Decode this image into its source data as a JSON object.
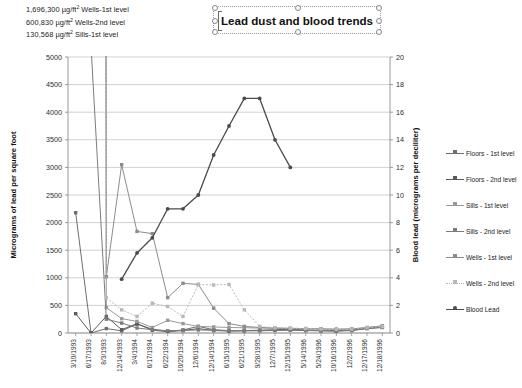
{
  "annotations": [
    {
      "value": "1,696,300",
      "unit": "µg/ft",
      "sup": "2",
      "text": "Wells-1st level"
    },
    {
      "value": "600,830",
      "unit": "µg/ft",
      "sup": "2",
      "text": "Wells-2nd level"
    },
    {
      "value": "130,568",
      "unit": "µg/ft",
      "sup": "2",
      "text": "Sills-1st level"
    }
  ],
  "title_box": {
    "title": "Lead dust and blood trends",
    "selected": true
  },
  "chart_data": {
    "type": "line",
    "title": "Lead dust and blood trends",
    "xlabel": "",
    "ylabel": "Micrograms of lead per square foot",
    "y2label": "Blood lead (micrograms per deciliter)",
    "ylim": [
      0,
      5000
    ],
    "yticks": [
      0,
      500,
      1000,
      1500,
      2000,
      2500,
      3000,
      3500,
      4000,
      4500,
      5000
    ],
    "y2lim": [
      0,
      20
    ],
    "y2ticks": [
      0,
      2,
      4,
      6,
      8,
      10,
      12,
      14,
      16,
      18,
      20
    ],
    "grid": true,
    "legend_position": "right",
    "categories": [
      "3/10/1993",
      "6/17/1993",
      "8/3/1993",
      "12/14/1993",
      "3/4/1994",
      "6/17/1994",
      "6/22/1994",
      "10/20/1994",
      "12/6/1994",
      "12/14/1994",
      "6/15/1995",
      "6/21/1995",
      "9/28/1995",
      "12/7/1995",
      "12/15/1995",
      "5/14/1996",
      "5/24/1996",
      "10/16/1996",
      "12/2/1996",
      "12/17/1996",
      "12/18/1996"
    ],
    "series": [
      {
        "name": "Floors - 1st level",
        "axis": "left",
        "color": "#6e6e6e",
        "values": [
          2180,
          0,
          80,
          40,
          160,
          70,
          30,
          55,
          120,
          60,
          40,
          45,
          50,
          60,
          70,
          55,
          45,
          40,
          50,
          90,
          110
        ]
      },
      {
        "name": "Floors - 2nd level",
        "axis": "left",
        "color": "#5a5a5a",
        "values": [
          350,
          0,
          300,
          60,
          170,
          50,
          25,
          45,
          80,
          45,
          35,
          40,
          45,
          50,
          55,
          45,
          40,
          35,
          45,
          80,
          100
        ]
      },
      {
        "name": "Sills - 1st level",
        "axis": "left",
        "color": "#9a9a9a",
        "values": [
          null,
          130568,
          460,
          260,
          210,
          100,
          230,
          170,
          120,
          110,
          100,
          95,
          90,
          85,
          80,
          75,
          70,
          65,
          70,
          95,
          120
        ]
      },
      {
        "name": "Sills - 2nd level",
        "axis": "left",
        "color": "#7c7c7c",
        "values": [
          null,
          5200,
          250,
          180,
          90,
          60,
          40,
          45,
          55,
          50,
          45,
          42,
          40,
          45,
          50,
          48,
          44,
          40,
          48,
          85,
          105
        ]
      },
      {
        "name": "Wells - 1st level",
        "axis": "left",
        "color": "#8c8c8c",
        "values": [
          null,
          1696300,
          1020,
          3050,
          1840,
          1800,
          640,
          900,
          880,
          450,
          170,
          120,
          100,
          90,
          85,
          80,
          75,
          70,
          75,
          100,
          130
        ]
      },
      {
        "name": "Wells - 2nd level",
        "axis": "left",
        "color": "#b8b8b8",
        "values": [
          null,
          600830,
          640,
          420,
          300,
          540,
          480,
          300,
          880,
          870,
          880,
          420,
          120,
          95,
          85,
          80,
          70,
          65,
          70,
          95,
          115
        ]
      },
      {
        "name": "Blood Lead",
        "axis": "right",
        "color": "#4b4b4b",
        "values": [
          null,
          null,
          null,
          3.9,
          5.8,
          6.9,
          9.0,
          9.0,
          10.0,
          12.9,
          15.0,
          17.0,
          17.0,
          14.0,
          12.0,
          null,
          null,
          null,
          null,
          null,
          null
        ]
      }
    ]
  },
  "legend": {
    "items": [
      {
        "label": "Floors - 1st level",
        "color": "#6e6e6e",
        "dash": "solid"
      },
      {
        "label": "Floors - 2nd level",
        "color": "#5a5a5a",
        "dash": "solid"
      },
      {
        "label": "Sills - 1st level",
        "color": "#9a9a9a",
        "dash": "solid"
      },
      {
        "label": "Sills - 2nd level",
        "color": "#7c7c7c",
        "dash": "solid"
      },
      {
        "label": "Wells - 1st level",
        "color": "#8c8c8c",
        "dash": "solid"
      },
      {
        "label": "Wells - 2nd level",
        "color": "#b8b8b8",
        "dash": "dotted"
      },
      {
        "label": "Blood Lead",
        "color": "#4b4b4b",
        "dash": "solid"
      }
    ]
  }
}
